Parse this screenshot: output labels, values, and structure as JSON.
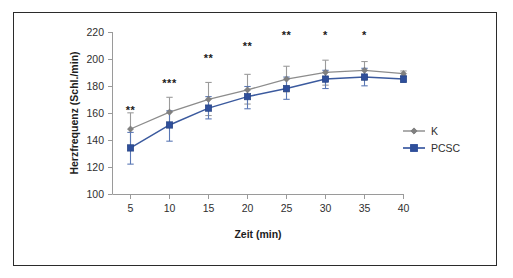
{
  "chart_data": {
    "type": "line",
    "title": "",
    "subtitle": "",
    "xlabel": "Zeit (min)",
    "ylabel": "Herzfrequenz (Schl./min)",
    "x": [
      5,
      10,
      15,
      20,
      25,
      30,
      35,
      40
    ],
    "xticklabels": [
      "5",
      "10",
      "15",
      "20",
      "25",
      "30",
      "35",
      "40"
    ],
    "xlim": [
      2.5,
      42.5
    ],
    "ylim": [
      100,
      220
    ],
    "yticks": [
      100,
      120,
      140,
      160,
      180,
      200,
      220
    ],
    "yticklabels": [
      "100",
      "120",
      "140",
      "160",
      "180",
      "200",
      "220"
    ],
    "grid": false,
    "legend_position": "right",
    "series": [
      {
        "name": "K",
        "color": "#808080",
        "marker": "diamond",
        "values": [
          148.5,
          161.0,
          170.5,
          177.5,
          185.5,
          190.5,
          192.0,
          189.5
        ],
        "error_upper": [
          12.0,
          11.0,
          12.5,
          11.5,
          9.5,
          9.0,
          6.5,
          2.0
        ],
        "error_lower": [
          12.5,
          10.5,
          12.0,
          10.5,
          9.5,
          9.5,
          7.0,
          2.0
        ]
      },
      {
        "name": "PCSC",
        "color": "#2f4f9b",
        "marker": "square",
        "values": [
          134.5,
          151.5,
          164.0,
          172.5,
          178.5,
          185.5,
          187.0,
          185.5
        ],
        "error_upper": [
          11.5,
          10.5,
          8.5,
          7.5,
          8.5,
          6.5,
          6.5,
          2.5
        ],
        "error_lower": [
          12.0,
          12.0,
          8.0,
          9.0,
          8.0,
          7.0,
          6.5,
          2.5
        ]
      }
    ],
    "annotations": [
      {
        "x": 5,
        "label": "**",
        "y_pixel_level": 160
      },
      {
        "x": 10,
        "label": "***",
        "y_pixel_level": 180
      },
      {
        "x": 15,
        "label": "**",
        "y_pixel_level": 198
      },
      {
        "x": 20,
        "label": "**",
        "y_pixel_level": 207
      },
      {
        "x": 25,
        "label": "**",
        "y_pixel_level": 215
      },
      {
        "x": 30,
        "label": "*",
        "y_pixel_level": 215
      },
      {
        "x": 35,
        "label": "*",
        "y_pixel_level": 215
      }
    ]
  },
  "legend": {
    "entries": [
      {
        "label": "K",
        "color": "#808080",
        "marker": "diamond"
      },
      {
        "label": "PCSC",
        "color": "#2f4f9b",
        "marker": "square"
      }
    ]
  },
  "colors": {
    "series_k": "#808080",
    "series_pcsc": "#2f4f9b",
    "axis": "#9a9a9a",
    "frame": "#2b2b2b",
    "background": "#ffffff",
    "text": "#2f2f2f"
  }
}
